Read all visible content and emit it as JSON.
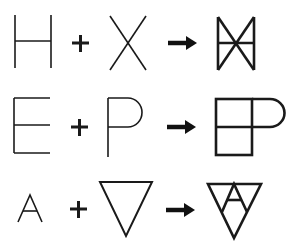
{
  "diagram": {
    "stroke_color": "#1a1a1a",
    "background": "#ffffff",
    "rows": [
      {
        "operand_a": "H",
        "operator": "+",
        "operand_b": "X",
        "arrow": "→",
        "result": "H superimposed with X (bowtie with crossbar)"
      },
      {
        "operand_a": "E",
        "operator": "+",
        "operand_b": "P",
        "arrow": "→",
        "result": "E mirrored and joined with P (square grid with P bowl)"
      },
      {
        "operand_a": "A",
        "operator": "+",
        "operand_b": "inverted triangle",
        "arrow": "→",
        "result": "A inside inverted triangle"
      }
    ]
  }
}
